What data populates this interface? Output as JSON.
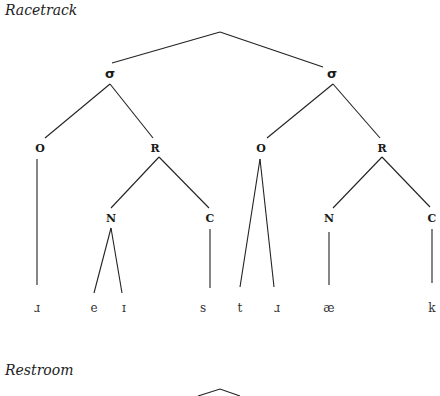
{
  "trees": [
    {
      "title": "Racetrack",
      "root": {
        "x": 220,
        "y": 32
      },
      "syllables": [
        {
          "label": "σ",
          "x": 110,
          "y": 72,
          "onset": {
            "label": "O",
            "x": 40,
            "y": 148,
            "segments": [
              {
                "label": "ɹ",
                "x": 37
              }
            ]
          },
          "rhyme": {
            "label": "R",
            "x": 155,
            "y": 148,
            "nucleus": {
              "label": "N",
              "x": 111,
              "y": 218,
              "segments": [
                {
                  "label": "e",
                  "x": 94
                },
                {
                  "label": "ɪ",
                  "x": 124
                }
              ]
            },
            "coda": {
              "label": "C",
              "x": 210,
              "y": 218,
              "segments": [
                {
                  "label": "s",
                  "x": 203
                }
              ]
            }
          }
        },
        {
          "label": "σ",
          "x": 332,
          "y": 72,
          "onset": {
            "label": "O",
            "x": 260,
            "y": 148,
            "segments": [
              {
                "label": "t",
                "x": 240
              },
              {
                "label": "ɹ",
                "x": 277
              }
            ]
          },
          "rhyme": {
            "label": "R",
            "x": 382,
            "y": 148,
            "nucleus": {
              "label": "N",
              "x": 329,
              "y": 218,
              "segments": [
                {
                  "label": "æ",
                  "x": 329
                }
              ]
            },
            "coda": {
              "label": "C",
              "x": 431,
              "y": 218,
              "segments": [
                {
                  "label": "k",
                  "x": 432
                }
              ]
            }
          }
        }
      ],
      "segment_row_y": 308
    },
    {
      "title": "Restroom",
      "root": {
        "x": 220,
        "y": 389
      }
    }
  ],
  "labels": {
    "tree1_title": "Racetrack",
    "tree2_title": "Restroom",
    "sigma": "σ",
    "onset": "O",
    "rhyme": "R",
    "nucleus": "N",
    "coda": "C",
    "segments": [
      "ɹ",
      "e",
      "ɪ",
      "s",
      "t",
      "ɹ",
      "æ",
      "k"
    ]
  }
}
